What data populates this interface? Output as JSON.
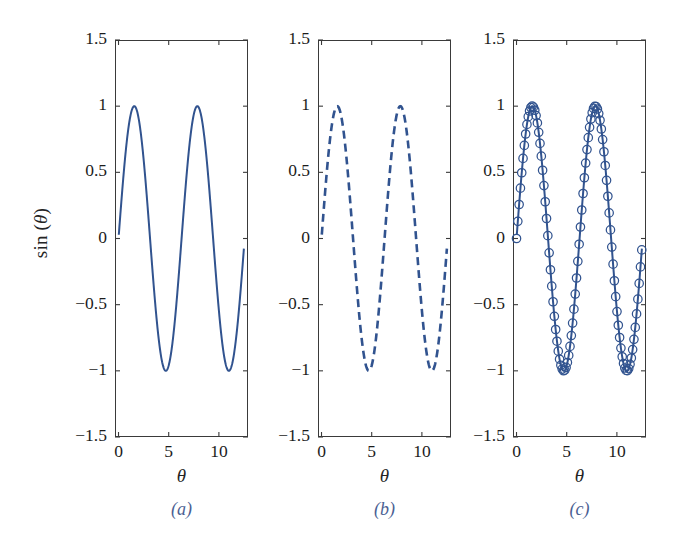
{
  "figure": {
    "ylabel_prefix": "sin (",
    "ylabel_theta": "θ",
    "ylabel_suffix": ")",
    "background": "#ffffff",
    "axis_color": "#3a3a3a",
    "curve_color": "#31538f",
    "caption_color": "#4b5f93"
  },
  "chart_data": [
    {
      "type": "line",
      "panel": "a",
      "caption": "(a)",
      "title": "",
      "xlabel": "θ",
      "ylabel": "sin (θ)",
      "style": "solid",
      "marker": "none",
      "line_color": "#31538f",
      "line_width": 2.0,
      "xlim": [
        -0.35,
        12.9
      ],
      "ylim": [
        -1.5,
        1.5
      ],
      "xticks": [
        0,
        5,
        10
      ],
      "xtick_labels": [
        "0",
        "5",
        "10"
      ],
      "yticks": [
        -1.5,
        -1,
        -0.5,
        0,
        0.5,
        1,
        1.5
      ],
      "ytick_labels": [
        "−1.5",
        "−1",
        "−0.5",
        "0",
        "0.5",
        "1",
        "1.5"
      ],
      "grid": false,
      "legend": "none",
      "function": "sin(theta)",
      "x": [
        0,
        0.25,
        0.5,
        0.75,
        1,
        1.25,
        1.5,
        1.75,
        2,
        2.25,
        2.5,
        2.75,
        3,
        3.25,
        3.5,
        3.75,
        4,
        4.25,
        4.5,
        4.75,
        5,
        5.25,
        5.5,
        5.75,
        6,
        6.25,
        6.5,
        6.75,
        7,
        7.25,
        7.5,
        7.75,
        8,
        8.25,
        8.5,
        8.75,
        9,
        9.25,
        9.5,
        9.75,
        10,
        10.25,
        10.5,
        10.75,
        11,
        11.25,
        11.5,
        11.75,
        12,
        12.25,
        12.5
      ],
      "y": [
        0,
        0.247,
        0.479,
        0.682,
        0.841,
        0.949,
        0.997,
        0.984,
        0.909,
        0.778,
        0.599,
        0.382,
        0.141,
        -0.108,
        -0.351,
        -0.572,
        -0.757,
        -0.895,
        -0.978,
        -0.999,
        -0.959,
        -0.859,
        -0.706,
        -0.508,
        -0.279,
        -0.033,
        0.215,
        0.452,
        0.657,
        0.82,
        0.938,
        0.994,
        0.989,
        0.923,
        0.798,
        0.625,
        0.412,
        0.174,
        -0.075,
        -0.32,
        -0.544,
        -0.734,
        -0.879,
        -0.969,
        -1.0,
        -0.967,
        -0.874,
        -0.726,
        -0.537,
        -0.312,
        -0.066
      ]
    },
    {
      "type": "line",
      "panel": "b",
      "caption": "(b)",
      "title": "",
      "xlabel": "θ",
      "ylabel": "sin (θ)",
      "style": "dashed",
      "dash_pattern": [
        8,
        5
      ],
      "marker": "none",
      "line_color": "#31538f",
      "line_width": 2.6,
      "xlim": [
        -0.35,
        12.9
      ],
      "ylim": [
        -1.5,
        1.5
      ],
      "xticks": [
        0,
        5,
        10
      ],
      "xtick_labels": [
        "0",
        "5",
        "10"
      ],
      "yticks": [
        -1.5,
        -1,
        -0.5,
        0,
        0.5,
        1,
        1.5
      ],
      "ytick_labels": [
        "−1.5",
        "−1",
        "−0.5",
        "0",
        "0.5",
        "1",
        "1.5"
      ],
      "grid": false,
      "legend": "none",
      "function": "sin(theta)",
      "x": [
        0,
        0.25,
        0.5,
        0.75,
        1,
        1.25,
        1.5,
        1.75,
        2,
        2.25,
        2.5,
        2.75,
        3,
        3.25,
        3.5,
        3.75,
        4,
        4.25,
        4.5,
        4.75,
        5,
        5.25,
        5.5,
        5.75,
        6,
        6.25,
        6.5,
        6.75,
        7,
        7.25,
        7.5,
        7.75,
        8,
        8.25,
        8.5,
        8.75,
        9,
        9.25,
        9.5,
        9.75,
        10,
        10.25,
        10.5,
        10.75,
        11,
        11.25,
        11.5,
        11.75,
        12,
        12.25,
        12.5
      ],
      "y": [
        0,
        0.247,
        0.479,
        0.682,
        0.841,
        0.949,
        0.997,
        0.984,
        0.909,
        0.778,
        0.599,
        0.382,
        0.141,
        -0.108,
        -0.351,
        -0.572,
        -0.757,
        -0.895,
        -0.978,
        -0.999,
        -0.959,
        -0.859,
        -0.706,
        -0.508,
        -0.279,
        -0.033,
        0.215,
        0.452,
        0.657,
        0.82,
        0.938,
        0.994,
        0.989,
        0.923,
        0.798,
        0.625,
        0.412,
        0.174,
        -0.075,
        -0.32,
        -0.544,
        -0.734,
        -0.879,
        -0.969,
        -1.0,
        -0.967,
        -0.874,
        -0.726,
        -0.537,
        -0.312,
        -0.066
      ]
    },
    {
      "type": "line",
      "panel": "c",
      "caption": "(c)",
      "title": "",
      "xlabel": "θ",
      "ylabel": "sin (θ)",
      "style": "solid-with-markers",
      "marker": "circle-open",
      "marker_size": 4.2,
      "line_color": "#31538f",
      "line_width": 2.0,
      "xlim": [
        -0.35,
        12.9
      ],
      "ylim": [
        -1.5,
        1.5
      ],
      "xticks": [
        0,
        5,
        10
      ],
      "xtick_labels": [
        "0",
        "5",
        "10"
      ],
      "yticks": [
        -1.5,
        -1,
        -0.5,
        0,
        0.5,
        1,
        1.5
      ],
      "ytick_labels": [
        "−1.5",
        "−1",
        "−0.5",
        "0",
        "0.5",
        "1",
        "1.5"
      ],
      "grid": false,
      "legend": "none",
      "function": "sin(theta)",
      "x": [
        0,
        0.25,
        0.5,
        0.75,
        1,
        1.25,
        1.5,
        1.75,
        2,
        2.25,
        2.5,
        2.75,
        3,
        3.25,
        3.5,
        3.75,
        4,
        4.25,
        4.5,
        4.75,
        5,
        5.25,
        5.5,
        5.75,
        6,
        6.25,
        6.5,
        6.75,
        7,
        7.25,
        7.5,
        7.75,
        8,
        8.25,
        8.5,
        8.75,
        9,
        9.25,
        9.5,
        9.75,
        10,
        10.25,
        10.5,
        10.75,
        11,
        11.25,
        11.5,
        11.75,
        12,
        12.25,
        12.5
      ],
      "y": [
        0,
        0.247,
        0.479,
        0.682,
        0.841,
        0.949,
        0.997,
        0.984,
        0.909,
        0.778,
        0.599,
        0.382,
        0.141,
        -0.108,
        -0.351,
        -0.572,
        -0.757,
        -0.895,
        -0.978,
        -0.999,
        -0.959,
        -0.859,
        -0.706,
        -0.508,
        -0.279,
        -0.033,
        0.215,
        0.452,
        0.657,
        0.82,
        0.938,
        0.994,
        0.989,
        0.923,
        0.798,
        0.625,
        0.412,
        0.174,
        -0.075,
        -0.32,
        -0.544,
        -0.734,
        -0.879,
        -0.969,
        -1.0,
        -0.967,
        -0.874,
        -0.726,
        -0.537,
        -0.312,
        -0.066
      ]
    }
  ]
}
